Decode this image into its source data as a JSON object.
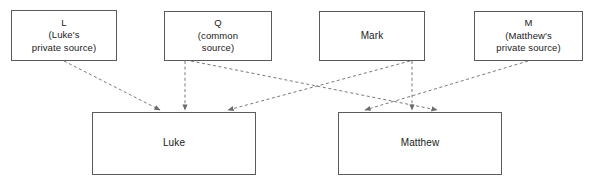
{
  "diagram": {
    "background_color": "#ffffff",
    "box_border_color": "#5a5a5a",
    "edge_color": "#7a7a7a",
    "text_color": "#1a1a1a",
    "sources": [
      {
        "id": "L",
        "label": "L\n(Luke's\nprivate source)",
        "x": 11,
        "y": 10,
        "w": 106,
        "h": 51
      },
      {
        "id": "Q",
        "label": "Q\n(common\nsource)",
        "x": 164,
        "y": 11,
        "w": 108,
        "h": 50
      },
      {
        "id": "Mark",
        "label": "Mark",
        "x": 319,
        "y": 11,
        "w": 106,
        "h": 50
      },
      {
        "id": "M",
        "label": "M\n(Matthew's\nprivate source)",
        "x": 474,
        "y": 11,
        "w": 109,
        "h": 50
      }
    ],
    "gospels": [
      {
        "id": "Luke",
        "label": "Luke",
        "x": 92,
        "y": 112,
        "w": 164,
        "h": 63
      },
      {
        "id": "Matthew",
        "label": "Matthew",
        "x": 338,
        "y": 112,
        "w": 164,
        "h": 63
      }
    ],
    "edges": [
      {
        "id": "L-to-Luke",
        "from": "L",
        "to": "Luke",
        "x1": 64,
        "y1": 61,
        "x2": 160,
        "y2": 110,
        "style": "dashed"
      },
      {
        "id": "Q-to-Luke",
        "from": "Q",
        "to": "Luke",
        "x1": 185,
        "y1": 61,
        "x2": 185,
        "y2": 110,
        "style": "dashed"
      },
      {
        "id": "Q-to-Matthew",
        "from": "Q",
        "to": "Matthew",
        "x1": 191,
        "y1": 61,
        "x2": 437,
        "y2": 110,
        "style": "dashed"
      },
      {
        "id": "Mark-to-Luke",
        "from": "Mark",
        "to": "Luke",
        "x1": 410,
        "y1": 61,
        "x2": 228,
        "y2": 110,
        "style": "dashed"
      },
      {
        "id": "Mark-to-Matthew",
        "from": "Mark",
        "to": "Matthew",
        "x1": 412,
        "y1": 61,
        "x2": 412,
        "y2": 110,
        "style": "dashed"
      },
      {
        "id": "M-to-Matthew",
        "from": "M",
        "to": "Matthew",
        "x1": 528,
        "y1": 61,
        "x2": 365,
        "y2": 110,
        "style": "dashed"
      }
    ]
  }
}
